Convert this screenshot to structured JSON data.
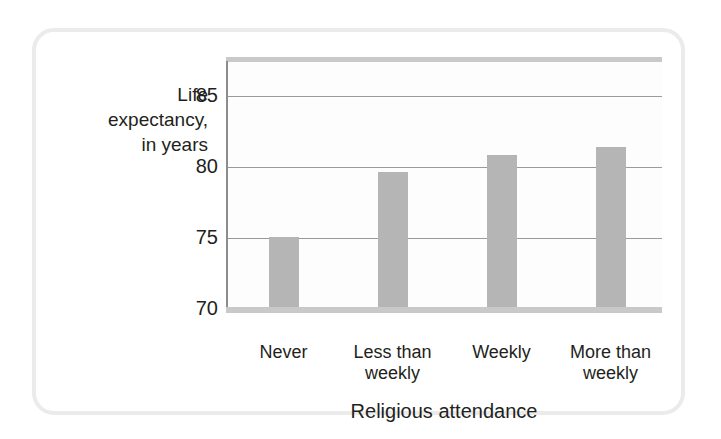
{
  "chart_data": {
    "type": "bar",
    "title": "",
    "xlabel": "Religious attendance",
    "ylabel": "Life expectancy, in years",
    "ylabel_lines": [
      "Life",
      "expectancy,",
      "in years"
    ],
    "categories": [
      "Never",
      "Less than weekly",
      "Weekly",
      "More than weekly"
    ],
    "category_lines": [
      [
        "Never"
      ],
      [
        "Less than",
        "weekly"
      ],
      [
        "Weekly"
      ],
      [
        "More than",
        "weekly"
      ]
    ],
    "values": [
      75.1,
      79.7,
      80.9,
      81.4
    ],
    "ylim": [
      70,
      87.5
    ],
    "yticks": [
      70,
      75,
      80,
      85
    ],
    "ytick_labels": [
      "70",
      "75",
      "80",
      "85"
    ],
    "grid": true,
    "gridlines_at": [
      75,
      80,
      85
    ],
    "legend": null,
    "bar_color": "#b5b5b5",
    "axis_color": "#8d8d8d",
    "grid_color": "#9a9a9a",
    "band_color": "#c9c9c9",
    "frame_color": "#ebebeb",
    "plot_background": "#fdfdfd",
    "text_color": "#231f20"
  }
}
